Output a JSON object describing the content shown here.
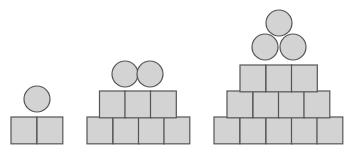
{
  "colors": {
    "fill": "#d3d3d3",
    "stroke": "#555555",
    "background": "#ffffff"
  },
  "figures": [
    {
      "name": "figure-1",
      "squares": [
        {
          "x": 11,
          "y": 117
        },
        {
          "x": 37,
          "y": 117
        }
      ],
      "circles": [
        {
          "cx": 37,
          "cy": 99
        }
      ]
    },
    {
      "name": "figure-2",
      "squares": [
        {
          "x": 87,
          "y": 117
        },
        {
          "x": 113,
          "y": 117
        },
        {
          "x": 138.5,
          "y": 117
        },
        {
          "x": 164,
          "y": 117
        },
        {
          "x": 99.5,
          "y": 91
        },
        {
          "x": 125,
          "y": 91
        },
        {
          "x": 150.5,
          "y": 91
        }
      ],
      "circles": [
        {
          "cx": 125,
          "cy": 74
        },
        {
          "cx": 150,
          "cy": 74
        }
      ]
    },
    {
      "name": "figure-3",
      "squares": [
        {
          "x": 214,
          "y": 117
        },
        {
          "x": 240,
          "y": 117
        },
        {
          "x": 266,
          "y": 117
        },
        {
          "x": 291.5,
          "y": 117
        },
        {
          "x": 317,
          "y": 117
        },
        {
          "x": 227,
          "y": 91
        },
        {
          "x": 253,
          "y": 91
        },
        {
          "x": 278.5,
          "y": 91
        },
        {
          "x": 304,
          "y": 91
        },
        {
          "x": 240,
          "y": 65
        },
        {
          "x": 266,
          "y": 65
        },
        {
          "x": 291.5,
          "y": 65
        }
      ],
      "circles": [
        {
          "cx": 279,
          "cy": 23
        },
        {
          "cx": 265,
          "cy": 47
        },
        {
          "cx": 293,
          "cy": 47
        }
      ]
    }
  ],
  "square_size": 25.8,
  "circle_radius": 13
}
